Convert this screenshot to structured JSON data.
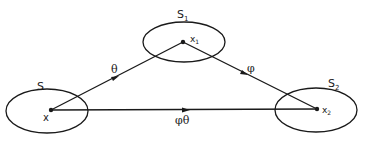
{
  "diagram": {
    "sets": [
      {
        "id": "S",
        "label": "S",
        "point_label": "x"
      },
      {
        "id": "S1",
        "label": "S",
        "label_sub": "1",
        "point_label": "x",
        "point_sub": "1"
      },
      {
        "id": "S2",
        "label": "S",
        "label_sub": "2",
        "point_label": "x",
        "point_sub": "2"
      }
    ],
    "arrows": [
      {
        "from": "x",
        "to": "x1",
        "label": "θ"
      },
      {
        "from": "x1",
        "to": "x2",
        "label": "φ"
      },
      {
        "from": "x",
        "to": "x2",
        "label": "φθ"
      }
    ],
    "stroke_color": "#1a1a1a"
  }
}
